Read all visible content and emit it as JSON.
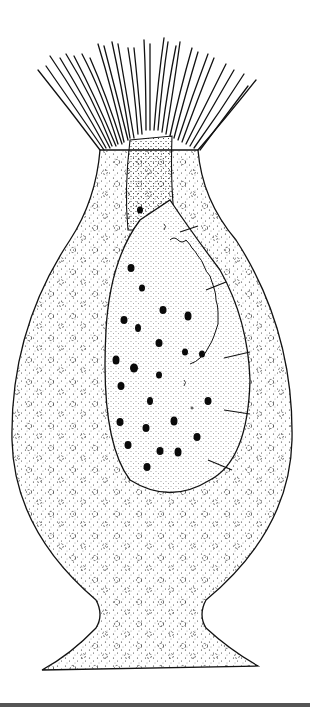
{
  "figure": {
    "style": "black ink stipple drawing on white",
    "colors": {
      "ink": "#111111",
      "background": "#ffffff",
      "bottom_bar": "#555555"
    },
    "parts": [
      "tentacle-crown",
      "outer-body",
      "inner-ovoid-body",
      "dark-granules",
      "septa",
      "stalk-base"
    ]
  }
}
